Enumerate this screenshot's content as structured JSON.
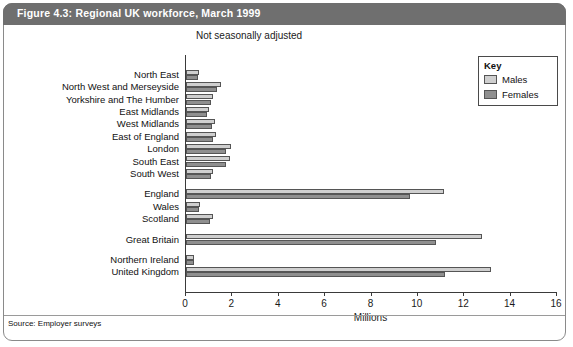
{
  "figure": {
    "title": "Figure 4.3: Regional UK workforce, March 1999",
    "subtitle": "Not seasonally adjusted",
    "source": "Source: Employer surveys",
    "title_bar_color": "#6f6f6f",
    "males_color": "#cfcfcf",
    "females_color": "#8f8f8f"
  },
  "key": {
    "title": "Key",
    "items": [
      {
        "label": "Males",
        "color": "#cfcfcf",
        "swatch": "males-swatch"
      },
      {
        "label": "Females",
        "color": "#8f8f8f",
        "swatch": "females-swatch"
      }
    ]
  },
  "chart_data": {
    "type": "bar",
    "orientation": "horizontal",
    "title": "Figure 4.3: Regional UK workforce, March 1999",
    "subtitle": "Not seasonally adjusted",
    "xlabel": "Millions",
    "ylabel": "",
    "xlim": [
      0,
      16
    ],
    "xticks": [
      0,
      2,
      4,
      6,
      8,
      10,
      12,
      14,
      16
    ],
    "xticklabels": [
      "0",
      "2",
      "4",
      "6",
      "8",
      "10",
      "12",
      "14",
      "16"
    ],
    "grid": false,
    "legend_position": "top-right",
    "categories": [
      "North East",
      "North West and Merseyside",
      "Yorkshire and The Humber",
      "East Midlands",
      "West Midlands",
      "East of England",
      "London",
      "South East",
      "South West",
      "England",
      "Wales",
      "Scotland",
      "Great Britain",
      "Northern Ireland",
      "United Kingdom"
    ],
    "group_breaks_after": [
      "South West",
      "Scotland",
      "Great Britain"
    ],
    "series": [
      {
        "name": "Males",
        "color": "#cfcfcf",
        "values": [
          0.58,
          1.49,
          1.18,
          1.01,
          1.27,
          1.29,
          1.92,
          1.91,
          1.18,
          11.14,
          0.61,
          1.15,
          12.78,
          0.36,
          13.14
        ]
      },
      {
        "name": "Females",
        "color": "#8f8f8f",
        "values": [
          0.52,
          1.33,
          1.06,
          0.9,
          1.1,
          1.16,
          1.71,
          1.73,
          1.07,
          9.68,
          0.55,
          1.02,
          10.8,
          0.33,
          11.18
        ]
      }
    ]
  }
}
